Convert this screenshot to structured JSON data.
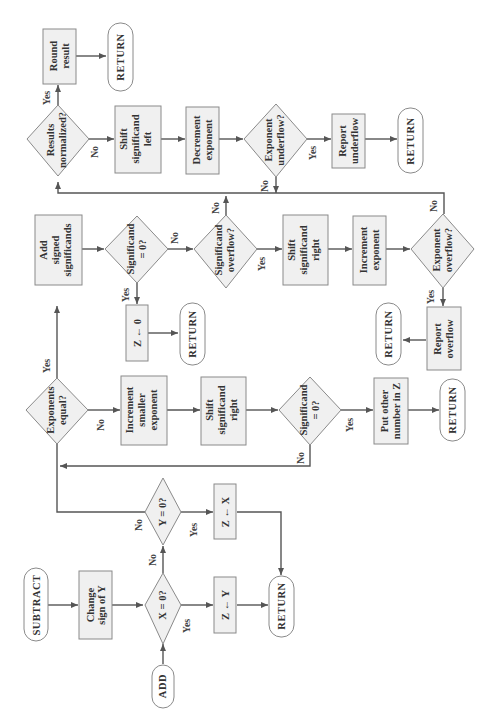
{
  "diagram": {
    "orientation": "rotated 90 degrees counter-clockwise",
    "nodes": {
      "add": {
        "type": "terminal",
        "lines": [
          "ADD"
        ]
      },
      "subtract": {
        "type": "terminal",
        "lines": [
          "SUBTRACT"
        ]
      },
      "change_sign": {
        "type": "process",
        "lines": [
          "Change",
          "sign of Y"
        ]
      },
      "x_zero": {
        "type": "decision",
        "lines": [
          "X = 0?"
        ]
      },
      "z_gets_y": {
        "type": "process",
        "lines": [
          "Z ← Y"
        ]
      },
      "y_zero": {
        "type": "decision",
        "lines": [
          "Y = 0?"
        ]
      },
      "z_gets_x": {
        "type": "process",
        "lines": [
          "Z ← X"
        ]
      },
      "return_1": {
        "type": "terminal",
        "lines": [
          "RETURN"
        ]
      },
      "exp_equal": {
        "type": "decision",
        "lines": [
          "Exponents",
          "equal?"
        ]
      },
      "inc_smaller": {
        "type": "process",
        "lines": [
          "Increment",
          "smaller",
          "exponent"
        ]
      },
      "shift_right_1": {
        "type": "process",
        "lines": [
          "Shift",
          "significand",
          "right"
        ]
      },
      "sig_zero_1": {
        "type": "decision",
        "lines": [
          "Significand",
          "= 0?"
        ]
      },
      "put_other": {
        "type": "process",
        "lines": [
          "Put other",
          "number in Z"
        ]
      },
      "return_2": {
        "type": "terminal",
        "lines": [
          "RETURN"
        ]
      },
      "add_signed": {
        "type": "process",
        "lines": [
          "Add",
          "signed",
          "significands"
        ]
      },
      "sig_zero_2": {
        "type": "decision",
        "lines": [
          "Significand",
          "= 0?"
        ]
      },
      "z_gets_0": {
        "type": "process",
        "lines": [
          "Z ← 0"
        ]
      },
      "return_3": {
        "type": "terminal",
        "lines": [
          "RETURN"
        ]
      },
      "sig_overflow": {
        "type": "decision",
        "lines": [
          "Significand",
          "overflow?"
        ]
      },
      "shift_right_2": {
        "type": "process",
        "lines": [
          "Shift",
          "significand",
          "right"
        ]
      },
      "inc_exp": {
        "type": "process",
        "lines": [
          "Increment",
          "exponent"
        ]
      },
      "exp_overflow": {
        "type": "decision",
        "lines": [
          "Exponent",
          "overflow?"
        ]
      },
      "report_overflow": {
        "type": "process",
        "lines": [
          "Report",
          "overflow"
        ]
      },
      "return_4": {
        "type": "terminal",
        "lines": [
          "RETURN"
        ]
      },
      "results_norm": {
        "type": "decision",
        "lines": [
          "Results",
          "normalized?"
        ]
      },
      "round": {
        "type": "process",
        "lines": [
          "Round",
          "result"
        ]
      },
      "return_5": {
        "type": "terminal",
        "lines": [
          "RETURN"
        ]
      },
      "shift_left": {
        "type": "process",
        "lines": [
          "Shift",
          "significand",
          "left"
        ]
      },
      "dec_exp": {
        "type": "process",
        "lines": [
          "Decrement",
          "exponent"
        ]
      },
      "exp_underflow": {
        "type": "decision",
        "lines": [
          "Exponent",
          "underflow?"
        ]
      },
      "report_underflow": {
        "type": "process",
        "lines": [
          "Report",
          "underflow"
        ]
      },
      "return_6": {
        "type": "terminal",
        "lines": [
          "RETURN"
        ]
      }
    },
    "edge_labels": {
      "x_zero_yes": "Yes",
      "x_zero_no": "No",
      "y_zero_yes": "Yes",
      "y_zero_no": "No",
      "exp_equal_yes": "Yes",
      "exp_equal_no": "No",
      "sig_zero_1_yes": "Yes",
      "sig_zero_1_no": "No",
      "sig_zero_2_yes": "Yes",
      "sig_zero_2_no": "No",
      "sig_overflow_yes": "Yes",
      "sig_overflow_no": "No",
      "exp_overflow_yes": "Yes",
      "exp_overflow_no": "No",
      "results_norm_yes": "Yes",
      "results_norm_no": "No",
      "exp_underflow_yes": "Yes",
      "exp_underflow_no": "No"
    },
    "colors": {
      "fill": "#f0f0f0",
      "stroke": "#8a8a8a",
      "line": "#555555",
      "text": "#333333"
    }
  }
}
